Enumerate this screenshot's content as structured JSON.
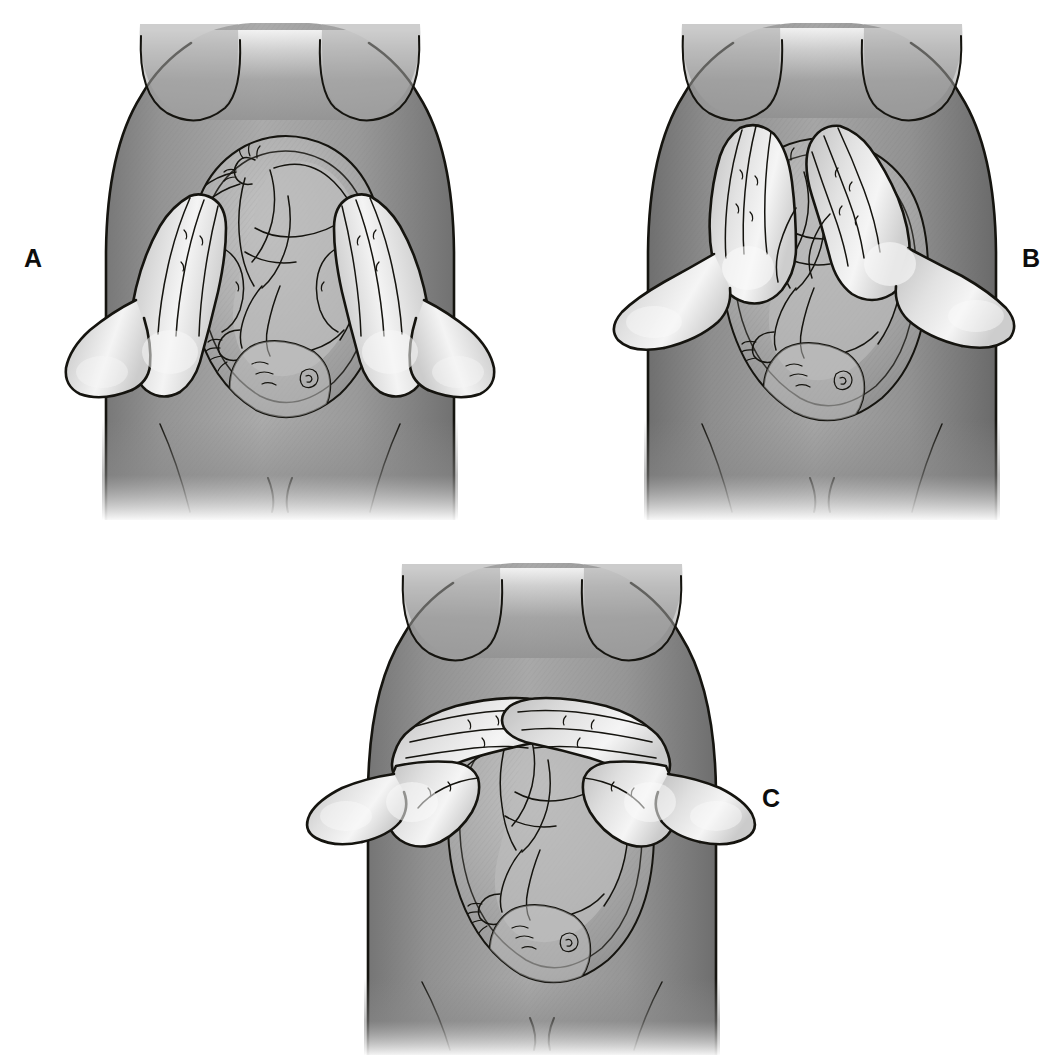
{
  "figure": {
    "background_color": "#ffffff",
    "ink_color": "#15140f",
    "panel_count": 3,
    "labels": [
      {
        "id": "A",
        "text": "A"
      },
      {
        "id": "B",
        "text": "B"
      },
      {
        "id": "C",
        "text": "C"
      }
    ]
  },
  "palette": {
    "background": "#ffffff",
    "torso_mid": "#9a9a9a",
    "torso_shadow": "#6f6f6f",
    "torso_deep_shadow": "#5a5a5a",
    "torso_highlight": "#c3c3c3",
    "uterus_fill": "#b4b4b4",
    "uterus_shadow": "#8f8f8f",
    "fetus_fill": "#bdbdbd",
    "hand_fill": "#d2d2d2",
    "hand_highlight": "#f2f2f2",
    "hand_shadow": "#a8a8a8",
    "outline": "#15140f"
  },
  "panels": [
    {
      "id": "A",
      "label": "A",
      "label_position": "left",
      "maneuver_name": "Second maneuver (umbilical grip)",
      "description": "Both hands flat on the lateral sides of the abdomen palpating for the fetal back and small parts",
      "hand_placement": "lateral-sides",
      "hand_count": 2,
      "fetal_presentation": "vertex",
      "fetal_back_side": "left"
    },
    {
      "id": "B",
      "label": "B",
      "label_position": "right",
      "maneuver_name": "First maneuver (fundal grip)",
      "description": "Both hands cupping the uterine fundus to identify the fetal pole occupying the fundus",
      "hand_placement": "fundus",
      "hand_count": 2,
      "fetal_presentation": "vertex",
      "fetal_back_side": "left"
    },
    {
      "id": "C",
      "label": "C",
      "label_position": "right",
      "maneuver_name": "Third / Pawlik's grip — pelvic grip",
      "description": "Fingertips of both hands meeting at the midline above the symphysis pubis to assess the presenting part",
      "hand_placement": "suprapubic-midline",
      "hand_count": 2,
      "fetal_presentation": "vertex",
      "fetal_back_side": "left"
    }
  ]
}
